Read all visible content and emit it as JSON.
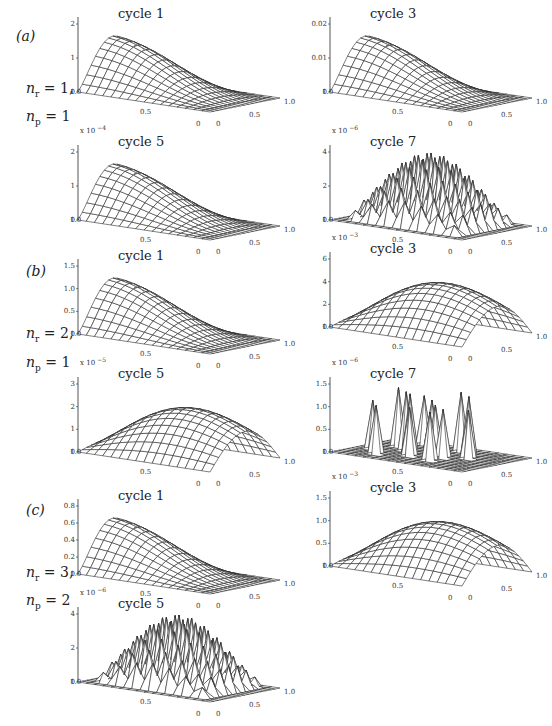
{
  "figure": {
    "groups": [
      {
        "label": "(a)",
        "params": {
          "nr_label": "n",
          "nr_sub": "r",
          "nr_value": "= 1,",
          "np_label": "n",
          "np_sub": "p",
          "np_value": "= 1"
        },
        "plots": [
          {
            "title": "cycle 1",
            "scale": "",
            "zticks": [
              "0",
              "1",
              "2"
            ],
            "shape": "smooth-ridge",
            "peak": 2.2
          },
          {
            "title": "cycle 3",
            "scale": "",
            "zticks": [
              "0",
              "0.01",
              "0.02"
            ],
            "shape": "smooth-ridge",
            "peak": 0.024
          },
          {
            "title": "cycle 5",
            "scale_base": "x 10",
            "scale_exp": "−4",
            "zticks": [
              "0",
              "1",
              "2"
            ],
            "shape": "smooth-ridge",
            "peak": 2.5
          },
          {
            "title": "cycle 7",
            "scale_base": "x 10",
            "scale_exp": "−6",
            "zticks": [
              "0",
              "2",
              "4"
            ],
            "shape": "checker-plateau",
            "peak": 4
          }
        ]
      },
      {
        "label": "(b)",
        "params": {
          "nr_label": "n",
          "nr_sub": "r",
          "nr_value": "= 2,",
          "np_label": "n",
          "np_sub": "p",
          "np_value": "= 1"
        },
        "plots": [
          {
            "title": "cycle 1",
            "scale": "",
            "zticks": [
              "0",
              "0.5",
              "1.0",
              "1.5"
            ],
            "shape": "smooth-ridge",
            "peak": 1.3
          },
          {
            "title": "cycle 3",
            "scale_base": "x 10",
            "scale_exp": "−3",
            "zticks": [
              "0",
              "2",
              "4",
              "6"
            ],
            "shape": "smooth-hump",
            "peak": 5
          },
          {
            "title": "cycle 5",
            "scale_base": "x 10",
            "scale_exp": "−5",
            "zticks": [
              "0",
              "1",
              "2",
              "3"
            ],
            "shape": "smooth-hump",
            "peak": 2.9
          },
          {
            "title": "cycle 7",
            "scale_base": "x 10",
            "scale_exp": "−6",
            "zticks": [
              "0",
              "0.5",
              "1.0",
              "1.5"
            ],
            "shape": "spikes",
            "peak": 1.3
          }
        ]
      },
      {
        "label": "(c)",
        "params": {
          "nr_label": "n",
          "nr_sub": "r",
          "nr_value": "= 3,",
          "np_label": "n",
          "np_sub": "p",
          "np_value": "= 2"
        },
        "plots": [
          {
            "title": "cycle 1",
            "scale": "",
            "zticks": [
              "0",
              "0.2",
              "0.4",
              "0.6",
              "0.8"
            ],
            "shape": "smooth-ridge",
            "peak": 0.8
          },
          {
            "title": "cycle 3",
            "scale_base": "x 10",
            "scale_exp": "−3",
            "zticks": [
              "0",
              "0.5",
              "1.0",
              "1.5"
            ],
            "shape": "smooth-hump",
            "peak": 1.2
          },
          {
            "title": "cycle 5",
            "scale_base": "x 10",
            "scale_exp": "−6",
            "zticks": [
              "0",
              "2",
              "4"
            ],
            "shape": "checker-plateau",
            "peak": 3.5
          }
        ]
      }
    ],
    "axis_ticks": {
      "left_axis": [
        "1.0",
        "0.5",
        "0"
      ],
      "right_axis": [
        "0",
        "0.5",
        "1.0"
      ]
    }
  },
  "colors": {
    "line": "#2a2a2a",
    "fill": "#ffffff",
    "text": "#222222"
  }
}
